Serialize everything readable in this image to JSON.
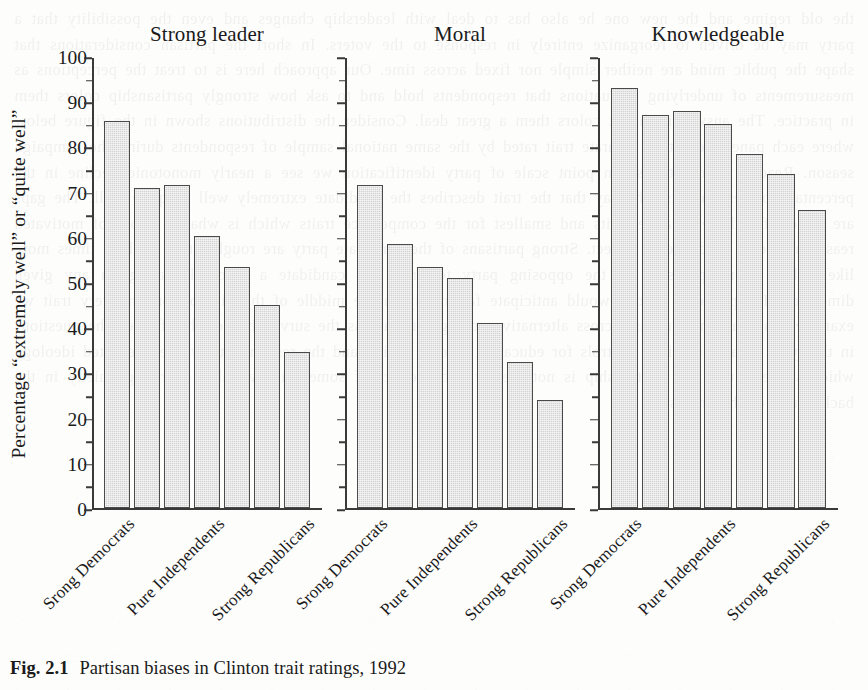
{
  "figure": {
    "caption_number": "Fig. 2.1",
    "caption_text": "Partisan biases in Clinton trait ratings, 1992"
  },
  "chart_data": {
    "type": "bar",
    "title": "Partisan biases in Clinton trait ratings, 1992",
    "xlabel": "",
    "ylabel": "Percentage “extremely well” or “quite well”",
    "ylim": [
      0,
      100
    ],
    "ytick_labels": [
      "0",
      "10",
      "20",
      "30",
      "40",
      "50",
      "60",
      "70",
      "80",
      "90",
      "100"
    ],
    "ytick_values": [
      0,
      10,
      20,
      30,
      40,
      50,
      60,
      70,
      80,
      90,
      100
    ],
    "minor_tick_step": 5,
    "grid": false,
    "legend": "none",
    "categories": [
      "Srong Democrats",
      "Weak Democrats",
      "Independent Democrats",
      "Pure Independents",
      "Independent Republicans",
      "Weak Republicans",
      "Strong Republicans"
    ],
    "xtick_labels_shown": [
      "Srong Democrats",
      "Pure Independents",
      "Strong Republicans"
    ],
    "xtick_label_positions": [
      0,
      3,
      6
    ],
    "panels": [
      {
        "title": "Strong leader",
        "values": [
          85.8,
          70.8,
          71.5,
          60.2,
          53.5,
          45.0,
          34.5
        ]
      },
      {
        "title": "Moral",
        "values": [
          71.5,
          58.5,
          53.5,
          51.0,
          41.0,
          32.5,
          24.0
        ]
      },
      {
        "title": "Knowledgeable",
        "values": [
          93.0,
          87.0,
          88.0,
          85.0,
          78.5,
          74.0,
          66.0
        ]
      }
    ]
  },
  "style": {
    "bar_fill": "#d3d3d3",
    "bar_edge": "#4a4a4a",
    "axis_color": "#3a3a3a",
    "page_background": "#fdfdfc",
    "text_color": "#1a1a1a"
  },
  "scan_artifact": {
    "bleed_text": "the old regime and the new one he also has to deal with leadership changes and even the possibility that a party may be driven to reorganize entirely in response to the voters. In short the partisan considerations that shape the public mind are neither simple nor fixed across time. Our approach here is to treat the perceptions as measurements of underlying evaluations that respondents hold and to ask how strongly partisanship colors them in practice. The answer is that it colors them a great deal. Consider the distributions shown in the figure below where each panel presents a separate trait rated by the same national sample of respondents during the campaign season. Reading across the seven point scale of party identification we see a nearly monotonic decline in the percentage of respondents who say that the trait describes the candidate extremely well or quite well. The gaps are largest for the evaluative traits and smallest for the competence traits which is what a theory of motivated reasoning would lead one to expect. Strong partisans of the candidate party are roughly two to three times more likely than strong partisans of the opposing party to grant the candidate a favorable rating on any given dimension. Independents as one would anticipate fall neatly in the middle of the distribution on every trait we examine. The pattern is robust across alternative codings and across the survey houses that fielded the questions in that year. It also survives controls for education income region and the respondent own self reported ideology which suggests that the relationship is not merely a byproduct of some third variable operating quietly in the background of the analysis."
  }
}
